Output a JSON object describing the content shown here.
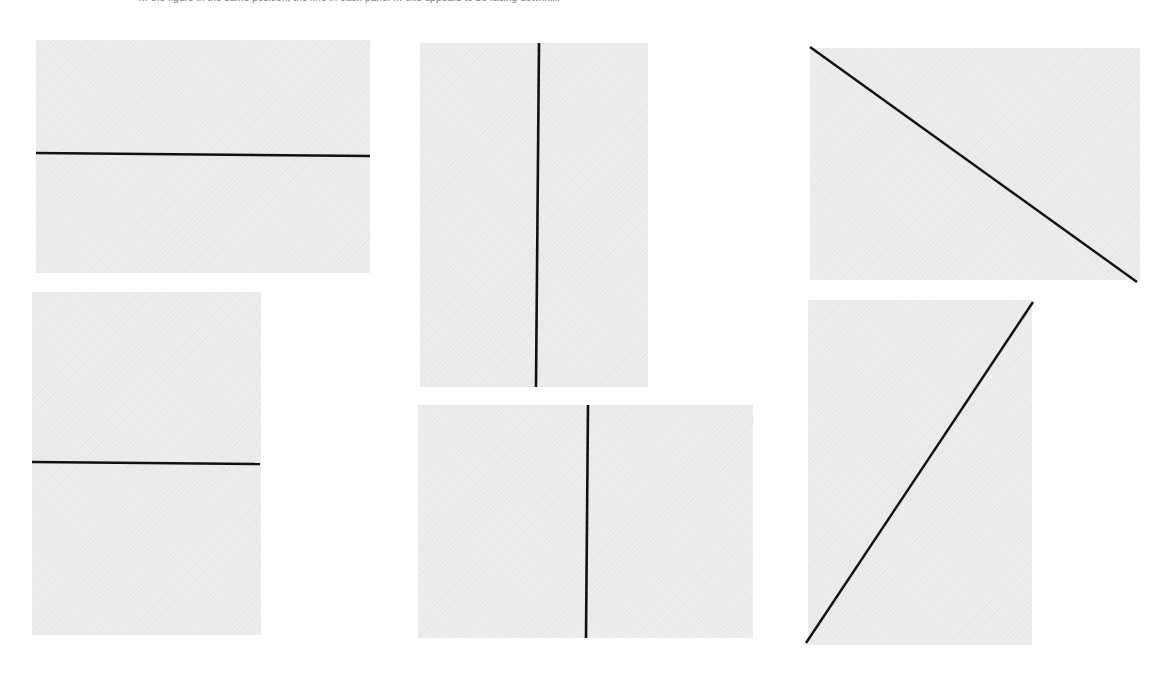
{
  "caption": {
    "text": "… the figure in the same position; the line in each panel … this appears to be facing downhill."
  },
  "colors": {
    "background": "#ffffff",
    "panel_fill": "#ebebeb",
    "line": "#111111",
    "caption_text": "#777777"
  },
  "panels": [
    {
      "id": "panel-1",
      "shape": "landscape",
      "line_orientation": "horizontal",
      "rect": {
        "x": 36,
        "y": 40,
        "w": 334,
        "h": 233
      },
      "line": {
        "x1": 36,
        "y1": 153,
        "x2": 370,
        "y2": 156
      }
    },
    {
      "id": "panel-2",
      "shape": "portrait",
      "line_orientation": "vertical",
      "rect": {
        "x": 420,
        "y": 43,
        "w": 228,
        "h": 344
      },
      "line": {
        "x1": 539,
        "y1": 43,
        "x2": 536,
        "y2": 387
      }
    },
    {
      "id": "panel-3",
      "shape": "landscape",
      "line_orientation": "diagonal-down",
      "rect": {
        "x": 810,
        "y": 48,
        "w": 330,
        "h": 232
      },
      "line": {
        "x1": 810,
        "y1": 47,
        "x2": 1137,
        "y2": 282
      }
    },
    {
      "id": "panel-4",
      "shape": "portrait",
      "line_orientation": "horizontal",
      "rect": {
        "x": 32,
        "y": 292,
        "w": 229,
        "h": 343
      },
      "line": {
        "x1": 32,
        "y1": 462,
        "x2": 260,
        "y2": 464
      }
    },
    {
      "id": "panel-5",
      "shape": "landscape",
      "line_orientation": "vertical",
      "rect": {
        "x": 418,
        "y": 405,
        "w": 335,
        "h": 233
      },
      "line": {
        "x1": 588,
        "y1": 405,
        "x2": 586,
        "y2": 638
      }
    },
    {
      "id": "panel-6",
      "shape": "portrait",
      "line_orientation": "diagonal-up",
      "rect": {
        "x": 808,
        "y": 300,
        "w": 224,
        "h": 345
      },
      "line": {
        "x1": 806,
        "y1": 643,
        "x2": 1033,
        "y2": 302
      }
    }
  ]
}
